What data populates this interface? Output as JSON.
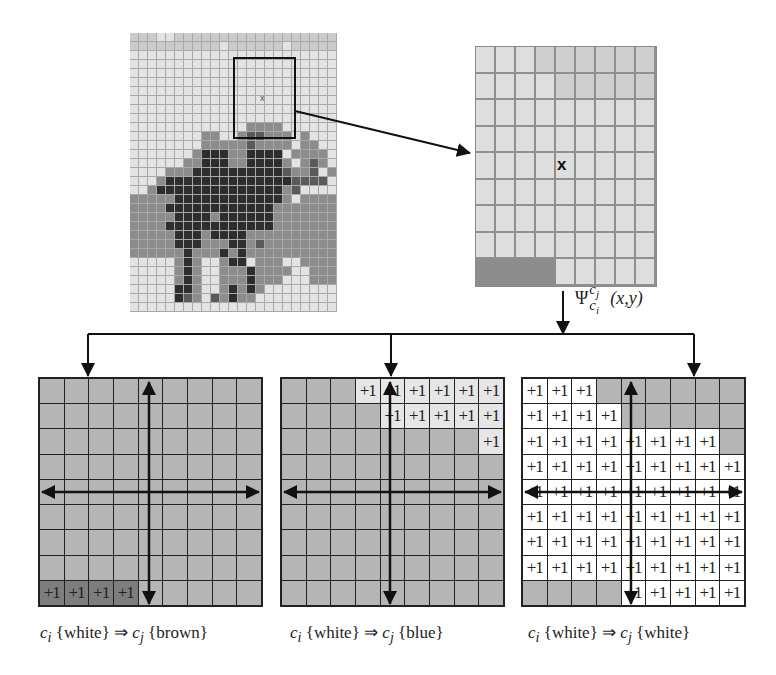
{
  "figure": {
    "source_image": {
      "description": "pixelated elephant image with grid overlay",
      "cols": 23,
      "rows": 31,
      "legend": {
        "0": "white/light",
        "1": "light gray",
        "2": "mid gray",
        "3": "dark brown",
        "4": "brown"
      },
      "selection_marker": "x",
      "pixels": [
        "11100111111111111111111",
        "11111111110111111011111",
        "00000000000000000000000",
        "00000000000000000000000",
        "00000000000000000000000",
        "00000000000000000000000",
        "00000000000000000000000",
        "00000000000000000000000",
        "00000000000000000000000",
        "00000000000000000000000",
        "00000000000000000000000",
        "00000000000000000000000",
        "00000000000000000000000",
        "00000000000000000000000",
        "00000000000000000000000",
        "00000000000000000000000",
        "00000000000000000000000",
        "00000000000000000000000",
        "00000000000000000000000",
        "00000000000000000000000",
        "00000000000000000000000",
        "00000000000000000000000",
        "00000000000000000000000",
        "00000000000000000000000",
        "00000000000000000000000",
        "00000000000000000000000",
        "00000000000000000000000",
        "00000000000000000000000",
        "00000000000000000000000",
        "00000000000000000000000",
        "00000000000000000000000"
      ],
      "elephant_rows": {
        "10": "00000000000002222000000",
        "11": "00000000220024422202000",
        "12": "00000000222224222202200",
        "13": "00000002333223333022220",
        "14": "00000022333223333202420",
        "15": "00002223333333333422402",
        "16": "00023333333333333344440",
        "17": "00233333333333333240000",
        "18": "22222333333333333202222",
        "19": "22223333333333332222222",
        "20": "22222333323333332222222",
        "21": "22223333333333332222222",
        "22": "22222333233332222222222",
        "23": "22222333222332422222222",
        "24": "22222232223232222222222",
        "25": "00000232002330222002222",
        "26": "00000232002223222200222",
        "27": "00000232002223222000222",
        "28": "00000332002323200000000",
        "29": "00000342042322000000000"
      }
    },
    "zoom_window": {
      "cols": 9,
      "rows": 9,
      "center_marker": "x",
      "bottom_left_dark_cells": 4
    },
    "transform_label": {
      "symbol": "Ψ",
      "superscript": "c",
      "superscript_sub": "j",
      "subscript": "c",
      "subscript_sub": "i",
      "args": "(x,y)"
    },
    "panels": [
      {
        "name": "brown",
        "caption": {
          "ci": "c",
          "ci_sub": "i",
          "from": " {white}",
          "arrow": " ⇒ ",
          "cj": "c",
          "cj_sub": "j",
          "to": " {brown}"
        },
        "cells": [
          "ggggggggg",
          "ggggggggg",
          "ggggggggg",
          "ggggggggg",
          "ggggggggg",
          "ggggggggg",
          "ggggggggg",
          "ggggggggg",
          "PPPPggggg"
        ]
      },
      {
        "name": "blue",
        "caption": {
          "ci": "c",
          "ci_sub": "i",
          "from": " {white}",
          "arrow": " ⇒ ",
          "cj": "c",
          "cj_sub": "j",
          "to": " {blue}"
        },
        "cells": [
          "gggLLLLLL",
          "ggggLLLLL",
          "ggggggggL",
          "ggggggggg",
          "ggggggggg",
          "ggggggggg",
          "ggggggggg",
          "ggggggggg",
          "ggggggggg"
        ]
      },
      {
        "name": "white",
        "caption": {
          "ci": "c",
          "ci_sub": "i",
          "from": " {white}",
          "arrow": " ⇒ ",
          "cj": "c",
          "cj_sub": "j",
          "to": " {white}"
        },
        "cells": [
          "WWWgggggg",
          "WWWWggggg",
          "WWWWWWWWg",
          "WWWWWWWWW",
          "WWWWWWWWW",
          "WWWWWWWWW",
          "WWWWWWWWW",
          "WWWWWWWWW",
          "ggggWWWWW"
        ]
      }
    ],
    "cell_increment_label": "+1"
  }
}
